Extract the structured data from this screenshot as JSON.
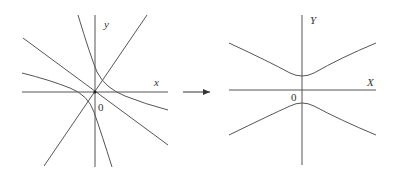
{
  "diagram": {
    "left": {
      "x_axis_label": "x",
      "y_axis_label": "y",
      "origin_label": "0"
    },
    "right": {
      "x_axis_label": "X",
      "y_axis_label": "Y",
      "origin_label": "0"
    },
    "arrow": "transform-arrow",
    "colors": {
      "stroke": "#555555",
      "text": "#333333",
      "background": "#ffffff"
    }
  }
}
